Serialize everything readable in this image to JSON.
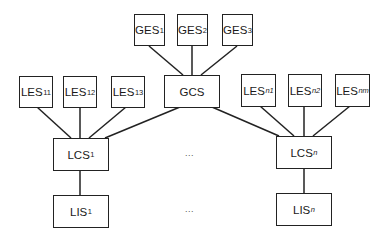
{
  "diagram": {
    "global_layer": {
      "coordinator": {
        "label": "GCS",
        "sub": ""
      },
      "entities": [
        {
          "label": "GES",
          "sub": "1"
        },
        {
          "label": "GES",
          "sub": "2"
        },
        {
          "label": "GES",
          "sub": "3"
        }
      ]
    },
    "local_sites": [
      {
        "coordinator": {
          "label": "LCS",
          "sub": "1"
        },
        "entities": [
          {
            "label": "LES",
            "sub": "11"
          },
          {
            "label": "LES",
            "sub": "12"
          },
          {
            "label": "LES",
            "sub": "13"
          }
        ],
        "interface": {
          "label": "LIS",
          "sub": "1"
        }
      },
      {
        "coordinator": {
          "label": "LCS",
          "sub": "n"
        },
        "entities": [
          {
            "label": "LES",
            "sub": "n1"
          },
          {
            "label": "LES",
            "sub": "n2"
          },
          {
            "label": "LES",
            "sub": "nm"
          }
        ],
        "interface": {
          "label": "LIS",
          "sub": "n"
        }
      }
    ],
    "ellipsis_coordinators": "...",
    "ellipsis_interfaces": "...",
    "line_color": "#222222"
  }
}
